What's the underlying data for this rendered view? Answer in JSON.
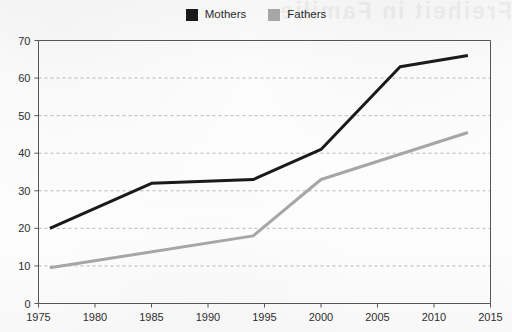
{
  "bleed_text": "Freiheit in Familie",
  "legend": {
    "items": [
      {
        "label": "Mothers",
        "color": "#1a1a1a",
        "swatch": "legend-swatch-mothers"
      },
      {
        "label": "Fathers",
        "color": "#a6a6a6",
        "swatch": "legend-swatch-fathers"
      }
    ]
  },
  "chart_data": {
    "type": "line",
    "title": "",
    "subtitle": "",
    "xlabel": "",
    "ylabel": "",
    "xlim": [
      1975,
      2015
    ],
    "ylim": [
      0,
      70
    ],
    "grid": true,
    "grid_axis": "y",
    "legend_position": "top-center",
    "x_ticks": [
      1975,
      1980,
      1985,
      1990,
      1995,
      2000,
      2005,
      2010,
      2015
    ],
    "y_ticks": [
      0,
      10,
      20,
      30,
      40,
      50,
      60,
      70
    ],
    "series": [
      {
        "name": "Mothers",
        "color": "#1a1a1a",
        "x": [
          1976,
          1985,
          1994,
          2000,
          2007,
          2013
        ],
        "values": [
          20,
          32,
          33,
          41,
          63,
          66
        ]
      },
      {
        "name": "Fathers",
        "color": "#a6a6a6",
        "x": [
          1976,
          1994,
          2000,
          2013
        ],
        "values": [
          9.5,
          18,
          33,
          45.5
        ]
      }
    ]
  },
  "axis": {
    "y_tick_labels": [
      "70",
      "60",
      "50",
      "40",
      "30",
      "20",
      "10",
      "0"
    ],
    "x_tick_labels": [
      "1975",
      "1980",
      "1985",
      "1990",
      "1995",
      "2000",
      "2005",
      "2010",
      "2015"
    ]
  },
  "colors": {
    "mothers": "#1a1a1a",
    "fathers": "#a6a6a6",
    "axis": "#555555",
    "grid": "#b9b9b9",
    "background": "#fbfbfb"
  }
}
